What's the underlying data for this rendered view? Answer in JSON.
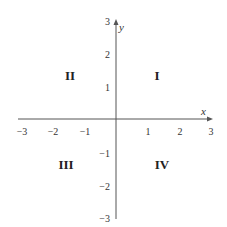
{
  "diagram": {
    "axes": {
      "x": {
        "name": "x",
        "range": [
          -3,
          3
        ],
        "ticks": [
          {
            "value": -3,
            "label": "−3"
          },
          {
            "value": -2,
            "label": "−2"
          },
          {
            "value": -1,
            "label": "−1"
          },
          {
            "value": 1,
            "label": "1"
          },
          {
            "value": 2,
            "label": "2"
          },
          {
            "value": 3,
            "label": "3"
          }
        ]
      },
      "y": {
        "name": "y",
        "range": [
          -3,
          3
        ],
        "ticks": [
          {
            "value": 3,
            "label": "3"
          },
          {
            "value": 2,
            "label": "2"
          },
          {
            "value": 1,
            "label": "1"
          },
          {
            "value": -1,
            "label": "−1"
          },
          {
            "value": -2,
            "label": "−2"
          },
          {
            "value": -3,
            "label": "−3"
          }
        ]
      }
    },
    "quadrants": [
      {
        "id": "I",
        "label": "I",
        "position": "top-right"
      },
      {
        "id": "II",
        "label": "II",
        "position": "top-left"
      },
      {
        "id": "III",
        "label": "III",
        "position": "bottom-left"
      },
      {
        "id": "IV",
        "label": "IV",
        "position": "bottom-right"
      }
    ],
    "colors": {
      "axis": "#555555",
      "text": "#333333"
    }
  }
}
